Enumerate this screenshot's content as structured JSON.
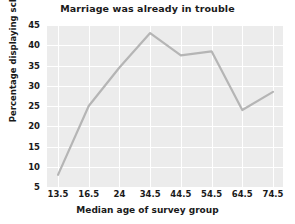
{
  "chart_data": {
    "type": "line",
    "title": "Marriage was already in trouble",
    "xlabel": "Median age of survey group",
    "ylabel": "Percentage displaying schema",
    "categories": [
      "13.5",
      "16.5",
      "24",
      "34.5",
      "44.5",
      "54.5",
      "64.5",
      "74.5"
    ],
    "values": [
      8,
      25,
      34.5,
      43,
      37.5,
      38.5,
      24,
      28.5
    ],
    "yticks": [
      "5",
      "10",
      "15",
      "20",
      "25",
      "30",
      "35",
      "40",
      "45"
    ],
    "ytick_values": [
      5,
      10,
      15,
      20,
      25,
      30,
      35,
      40,
      45
    ],
    "ylim": [
      5,
      45
    ],
    "grid": true,
    "legend": "none",
    "series_color": "#b5b5b5",
    "plot_background": "#ececec",
    "gridline_color": "#ffffff",
    "text_color": "#1a1a1a"
  }
}
